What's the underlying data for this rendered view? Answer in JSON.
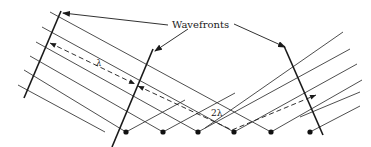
{
  "diagram": {
    "title_label": "Wavefronts",
    "wavelength_label": "λ",
    "double_wavelength_label": "2λ",
    "colors": {
      "line": "#3a3a3a",
      "wavefront": "#1a1a1a",
      "dot": "#111111",
      "background": "#ffffff"
    },
    "incident_rays": [
      {
        "x1": 50,
        "y1": 12,
        "x2": 271,
        "y2": 132
      },
      {
        "x1": 42,
        "y1": 27,
        "x2": 234,
        "y2": 132
      },
      {
        "x1": 36,
        "y1": 42,
        "x2": 198,
        "y2": 132
      },
      {
        "x1": 30,
        "y1": 56,
        "x2": 163,
        "y2": 132
      },
      {
        "x1": 24,
        "y1": 70,
        "x2": 126,
        "y2": 132
      },
      {
        "x1": 18,
        "y1": 85,
        "x2": 105,
        "y2": 132
      }
    ],
    "reflected_rays": [
      {
        "x1": 126,
        "y1": 132,
        "x2": 185,
        "y2": 100
      },
      {
        "x1": 163,
        "y1": 132,
        "x2": 235,
        "y2": 93
      },
      {
        "x1": 198,
        "y1": 132,
        "x2": 350,
        "y2": 49
      },
      {
        "x1": 234,
        "y1": 132,
        "x2": 357,
        "y2": 64
      },
      {
        "x1": 271,
        "y1": 132,
        "x2": 362,
        "y2": 80
      },
      {
        "x1": 310,
        "y1": 132,
        "x2": 360,
        "y2": 106
      }
    ],
    "extra_reflected": [
      {
        "x1": 205,
        "y1": 128,
        "x2": 343,
        "y2": 32
      },
      {
        "x1": 300,
        "y1": 117,
        "x2": 360,
        "y2": 92
      }
    ],
    "scatter_points": [
      {
        "x": 126,
        "y": 132
      },
      {
        "x": 163,
        "y": 132
      },
      {
        "x": 198,
        "y": 132
      },
      {
        "x": 234,
        "y": 132
      },
      {
        "x": 271,
        "y": 132
      },
      {
        "x": 310,
        "y": 132
      }
    ],
    "wavefronts": [
      {
        "name": "incident-left",
        "x1": 61,
        "y1": 11,
        "x2": 24,
        "y2": 98
      },
      {
        "name": "incident-middle",
        "x1": 153,
        "y1": 49,
        "x2": 112,
        "y2": 147
      },
      {
        "name": "reflected-right",
        "x1": 284,
        "y1": 46,
        "x2": 323,
        "y2": 135
      }
    ],
    "path_difference": {
      "lambda_segment": {
        "x1": 50,
        "y1": 43,
        "x2": 135,
        "y2": 84
      },
      "lambda_label_pos": {
        "x": 96,
        "y": 66
      },
      "two_lambda_path": [
        [
          138,
          86
        ],
        [
          232,
          130
        ],
        [
          316,
          95
        ]
      ],
      "two_lambda_label_pos": {
        "x": 211,
        "y": 116
      }
    },
    "label_pointers": [
      {
        "from": [
          168,
          25
        ],
        "to": [
          63,
          13
        ]
      },
      {
        "from": [
          188,
          29
        ],
        "to": [
          155,
          51
        ]
      },
      {
        "from": [
          234,
          24
        ],
        "to": [
          285,
          47
        ]
      }
    ],
    "title_label_pos": {
      "x": 172,
      "y": 28
    }
  }
}
